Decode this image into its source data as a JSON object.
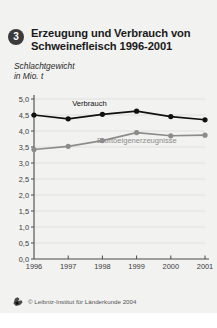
{
  "card": {
    "background": "#f2f2f1"
  },
  "header": {
    "number": "3",
    "title_line1": "Erzeugung und Verbrauch von",
    "title_line2": "Schweinefleisch 1996-2001",
    "subtitle_line1": "Schlachtgewicht",
    "subtitle_line2": "in Mio. t"
  },
  "footer": {
    "logo_name": "leibniz-institut-logo",
    "copyright": "© Leibniz-Institut für Länderkunde 2004"
  },
  "chart_data": {
    "type": "line",
    "title": "Erzeugung und Verbrauch von Schweinefleisch 1996-2001",
    "subtitle": "Schlachtgewicht in Mio. t",
    "xlabel": "",
    "ylabel": "",
    "categories": [
      "1996",
      "1997",
      "1998",
      "1999",
      "2000",
      "2001"
    ],
    "ylim": [
      0.0,
      5.0
    ],
    "yticks": [
      "0,0",
      "0,5",
      "1,0",
      "1,5",
      "2,0",
      "2,5",
      "3,0",
      "3,5",
      "4,0",
      "4,5",
      "5,0"
    ],
    "ytick_values": [
      0.0,
      0.5,
      1.0,
      1.5,
      2.0,
      2.5,
      3.0,
      3.5,
      4.0,
      4.5,
      5.0
    ],
    "grid": true,
    "legend_position": "inline-labels",
    "series": [
      {
        "name": "Verbrauch",
        "color": "#111111",
        "values": [
          4.5,
          4.38,
          4.52,
          4.62,
          4.45,
          4.35
        ]
      },
      {
        "name": "Bruttoeigenerzeugnisse",
        "color": "#8c8c8c",
        "values": [
          3.42,
          3.52,
          3.7,
          3.95,
          3.85,
          3.87
        ]
      }
    ]
  }
}
